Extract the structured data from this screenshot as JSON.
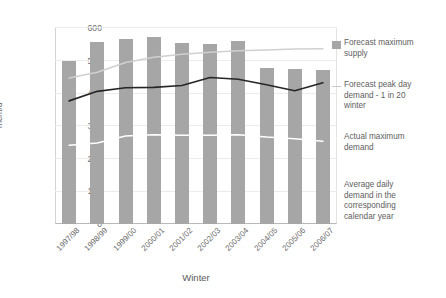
{
  "chart_data": {
    "type": "bar",
    "title": "",
    "xlabel": "Winter",
    "ylabel": "mcm/d",
    "ylim": [
      0,
      600
    ],
    "yticks": [
      0,
      100,
      200,
      300,
      400,
      500,
      600
    ],
    "grid": true,
    "legend_position": "right",
    "categories": [
      "1997/98",
      "1998/99",
      "1999/00",
      "2000/01",
      "2001/02",
      "2002/03",
      "2003/04",
      "2004/05",
      "2005/06",
      "2006/07"
    ],
    "series": [
      {
        "name": "Forecast maximum supply",
        "type": "bar",
        "color": "#a6a6a6",
        "values": [
          495,
          555,
          562,
          570,
          552,
          548,
          558,
          475,
          472,
          468
        ]
      },
      {
        "name": "Forecast peak day demand - 1 in 20 winter",
        "type": "line",
        "color": "#d0d0d0",
        "values": [
          445,
          462,
          492,
          508,
          517,
          523,
          528,
          530,
          533,
          534
        ]
      },
      {
        "name": "Actual maximum demand",
        "type": "line",
        "color": "#262626",
        "values": [
          375,
          404,
          415,
          416,
          422,
          446,
          441,
          424,
          406,
          430
        ]
      },
      {
        "name": "Average daily demand in the corresponding calendar year",
        "type": "line",
        "color": "#ffffff",
        "values": [
          240,
          247,
          268,
          272,
          270,
          270,
          272,
          265,
          260,
          252
        ]
      }
    ]
  },
  "legend": {
    "items": [
      {
        "label": "Forecast maximum\nsupply",
        "key": "swatch",
        "color": "#a6a6a6"
      },
      {
        "label": "Forecast peak day\ndemand - 1 in 20\nwinter",
        "key": "line",
        "color": "#d0d0d0"
      },
      {
        "label": "Actual maximum\ndemand",
        "key": "line-white",
        "color": "#ffffff"
      },
      {
        "label": "Average daily\ndemand in the\ncorresponding\ncalendar year",
        "key": "none",
        "color": "#ffffff"
      }
    ]
  },
  "axes": {
    "y_title": "mcm/d",
    "x_title": "Winter",
    "y_tick_labels": [
      "600",
      "500",
      "400",
      "300",
      "200",
      "100",
      "0"
    ]
  }
}
